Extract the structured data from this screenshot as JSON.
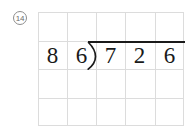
{
  "worksheet": {
    "problem_number": "14",
    "background_color": "#ffffff",
    "grid_line_color": "#dcdcdc",
    "ink_color": "#1a1a1a"
  },
  "grid": {
    "columns": 5,
    "rows": 4,
    "cell_width": 29,
    "cell_height": 28.5
  },
  "division": {
    "type": "long-division",
    "divisor": "86",
    "dividend": "726",
    "divisor_digits": [
      "8",
      "6"
    ],
    "dividend_digits": [
      "7",
      "2",
      "6"
    ],
    "quotient_digits": [
      "",
      "",
      ""
    ],
    "bracket_glyph": ")"
  }
}
